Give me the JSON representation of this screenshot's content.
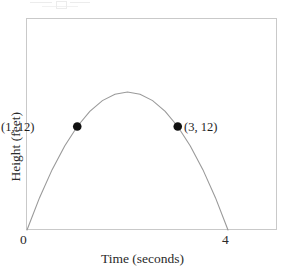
{
  "figure": {
    "kind": "coordinate-graph",
    "artifact_note": "faint cropped text remnant at top edge of scan"
  },
  "axes": {
    "x_title": "Time (seconds)",
    "y_title": "Height (feet)",
    "x_ticks": [
      {
        "label": "0",
        "value": 0
      },
      {
        "label": "4",
        "value": 4
      }
    ],
    "y_ticks": []
  },
  "annotations": [
    {
      "label": "(1, 12)",
      "x": 1,
      "y": 12,
      "side": "left"
    },
    {
      "label": "(3, 12)",
      "x": 3,
      "y": 12,
      "side": "right"
    }
  ],
  "colors": {
    "curve": "#9a9a9a",
    "frame": "#c9c9c9",
    "marker": "#111111",
    "text": "#2a2a2a",
    "background": "#ffffff"
  },
  "chart_data": {
    "type": "line",
    "title": "",
    "subtitle": "",
    "xlabel": "Time (seconds)",
    "ylabel": "Height (feet)",
    "xlim": [
      0,
      5
    ],
    "ylim": [
      0,
      20
    ],
    "grid": false,
    "legend": null,
    "series": [
      {
        "name": "Height of object over time",
        "shape": "parabola",
        "equation": "h = -4t(t - 4)",
        "vertex": {
          "x": 2,
          "y": 16
        },
        "roots": [
          0,
          4
        ],
        "x": [
          0,
          0.25,
          0.5,
          0.75,
          1,
          1.25,
          1.5,
          1.75,
          2,
          2.25,
          2.5,
          2.75,
          3,
          3.25,
          3.5,
          3.75,
          4
        ],
        "y": [
          0,
          3.75,
          7,
          9.75,
          12,
          13.75,
          15,
          15.75,
          16,
          15.75,
          15,
          13.75,
          12,
          9.75,
          7,
          3.75,
          0
        ]
      }
    ],
    "points": [
      {
        "label": "(1, 12)",
        "x": 1,
        "y": 12
      },
      {
        "label": "(3, 12)",
        "x": 3,
        "y": 12
      }
    ],
    "xticks": [
      0,
      4
    ],
    "xticklabels": [
      "0",
      "4"
    ],
    "yticks": [],
    "yticklabels": []
  }
}
